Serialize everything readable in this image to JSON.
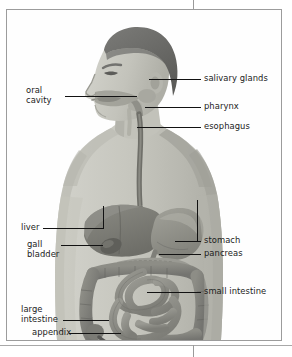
{
  "figure": {
    "style": "grayscale-halftone-illustration",
    "frame_color": "#9c9c9c",
    "background_color": "#ffffff"
  },
  "labels": {
    "oral_cavity": "oral\ncavity",
    "salivary_glands": "salivary glands",
    "pharynx": "pharynx",
    "esophagus": "esophagus",
    "liver": "liver",
    "gall_bladder": "gall\nbladder",
    "stomach": "stomach",
    "pancreas": "pancreas",
    "small_intestine": "small intestine",
    "large_intestine": "large\nintestine",
    "appendix": "appendix"
  },
  "colors": {
    "skin": "#c9c9c2",
    "skin_shadow": "#b0b0a8",
    "hair": "#6f6f6c",
    "organ_dark": "#7c7c76",
    "organ_mid": "#8f8f88",
    "organ_light": "#a3a39c",
    "leader_line": "#121212",
    "text": "#1b1b1b"
  }
}
